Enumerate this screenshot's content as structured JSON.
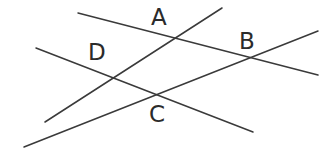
{
  "figure": {
    "kind": "geometry-diagram",
    "width": 333,
    "height": 156,
    "background_color": "#ffffff",
    "line_color": "#3a3a3a",
    "label_color": "#2b2b2b",
    "line_width": 1.5
  },
  "chart_data": {
    "type": "scatter",
    "title": "",
    "xlabel": "",
    "ylabel": "",
    "grid": false,
    "legend": "none",
    "xlim": [
      0,
      333
    ],
    "ylim": [
      0,
      156
    ],
    "points": [
      {
        "label": "A",
        "x": 163,
        "y": 38
      },
      {
        "label": "B",
        "x": 250,
        "y": 59
      },
      {
        "label": "C",
        "x": 161,
        "y": 97
      },
      {
        "label": "D",
        "x": 100,
        "y": 73
      }
    ],
    "lines": [
      {
        "name": "line-through-A-and-B",
        "x1": 78,
        "y1": 13,
        "x2": 318,
        "y2": 75,
        "passes_through": [
          "A",
          "B"
        ]
      },
      {
        "name": "line-through-D-and-C",
        "x1": 36,
        "y1": 48,
        "x2": 253,
        "y2": 132,
        "passes_through": [
          "D",
          "C"
        ]
      },
      {
        "name": "line-through-D-and-A",
        "x1": 45,
        "y1": 122,
        "x2": 222,
        "y2": 8,
        "passes_through": [
          "D",
          "A"
        ]
      },
      {
        "name": "line-through-C-and-B",
        "x1": 24,
        "y1": 147,
        "x2": 318,
        "y2": 31,
        "passes_through": [
          "C",
          "B"
        ]
      }
    ]
  },
  "labels": {
    "a": {
      "text": "A",
      "left": 151,
      "top": 6
    },
    "b": {
      "text": "B",
      "left": 239,
      "top": 30
    },
    "c": {
      "text": "C",
      "left": 149,
      "top": 103
    },
    "d": {
      "text": "D",
      "left": 88,
      "top": 41
    }
  }
}
